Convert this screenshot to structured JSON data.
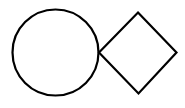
{
  "diagram": {
    "background": "#ffffff",
    "stroke_color": "#000000",
    "stroke_width": 2.2,
    "shapes": [
      {
        "type": "circle",
        "name": "circle",
        "cx": 55.5,
        "cy": 52.5,
        "r": 43,
        "fill": "#ffffff"
      },
      {
        "type": "diamond",
        "name": "diamond",
        "points": [
          [
            138,
            12.5
          ],
          [
            176.5,
            52.5
          ],
          [
            138.5,
            93.5
          ],
          [
            99,
            52.5
          ]
        ],
        "fill": "#ffffff"
      }
    ]
  }
}
